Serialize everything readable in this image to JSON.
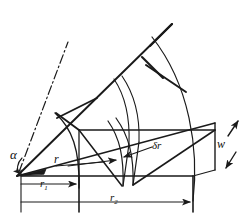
{
  "figure": {
    "type": "engineering-line-diagram",
    "width": 247,
    "height": 220,
    "stroke_color": "#1a1a1a",
    "background_color": "#ffffff"
  },
  "labels": {
    "alpha": "α",
    "radius": "r",
    "inner_radius": "r",
    "inner_radius_sub": "1",
    "outer_radius": "r",
    "outer_radius_sub": "2",
    "element_width": "δr",
    "depth": "w"
  },
  "geometry": {
    "apex": [
      17,
      176
    ],
    "sector_angle_deg": 26,
    "inner_arc_radius_px": 62,
    "outer_arc_radius_px": 176,
    "element_inner_radius_px": 104,
    "element_outer_radius_px": 115,
    "depth_px": 40
  },
  "dimensions": {
    "r1_line_y": 184,
    "r1_start_x": 21,
    "r1_end_x": 78,
    "r2_line_y": 202,
    "r2_start_x": 21,
    "r2_end_x": 187
  }
}
